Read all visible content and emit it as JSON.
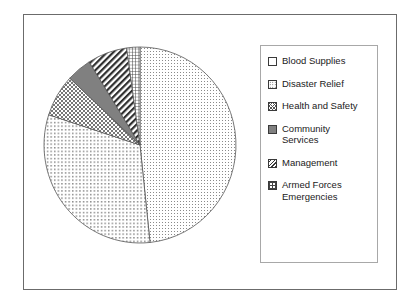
{
  "chart_data": {
    "type": "pie",
    "title": "",
    "categories": [
      "Blood Supplies",
      "Disaster Relief",
      "Health and Safety",
      "Community Services",
      "Management",
      "Armed Forces Emergencies"
    ],
    "values": [
      48.3,
      31.7,
      7.0,
      4.2,
      6.7,
      2.1
    ],
    "units": "percent",
    "start_angle_deg": 0,
    "direction": "clockwise",
    "legend_position": "right",
    "grid": false,
    "slices": [
      {
        "label": "Blood Supplies",
        "value": 48.3,
        "start_angle_deg": 0,
        "end_angle_deg": 174,
        "pattern": "fine-dots",
        "swatch_icon": "fine-dots-swatch"
      },
      {
        "label": "Disaster Relief",
        "value": 31.7,
        "start_angle_deg": 174,
        "end_angle_deg": 288,
        "pattern": "medium-dots",
        "swatch_icon": "medium-dots-swatch"
      },
      {
        "label": "Health and Safety",
        "value": 7.0,
        "start_angle_deg": 288,
        "end_angle_deg": 313,
        "pattern": "crosshatch",
        "swatch_icon": "crosshatch-swatch"
      },
      {
        "label": "Community Services",
        "value": 4.2,
        "start_angle_deg": 313,
        "end_angle_deg": 328,
        "pattern": "solid-gray",
        "swatch_icon": "solid-gray-swatch"
      },
      {
        "label": "Management",
        "value": 6.7,
        "start_angle_deg": 328,
        "end_angle_deg": 352,
        "pattern": "diagonal-stripes",
        "swatch_icon": "diagonal-stripes-swatch"
      },
      {
        "label": "Armed Forces Emergencies",
        "value": 2.1,
        "start_angle_deg": 352,
        "end_angle_deg": 360,
        "pattern": "grid",
        "swatch_icon": "grid-swatch"
      }
    ]
  },
  "legend": {
    "items": [
      {
        "label": "Blood Supplies"
      },
      {
        "label": "Disaster Relief"
      },
      {
        "label": "Health and Safety"
      },
      {
        "label": "Community\nServices"
      },
      {
        "label": "Management"
      },
      {
        "label": "Armed Forces\nEmergencies"
      }
    ]
  },
  "colors": {
    "frame_border": "#6b6b6b",
    "legend_border": "#a8a8a8",
    "slice_outline": "#555555",
    "text": "#1a1a1a",
    "background": "#ffffff",
    "solid_gray_slice": "#808080"
  }
}
